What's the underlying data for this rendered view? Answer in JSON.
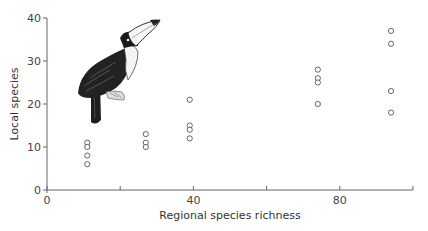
{
  "chart_data": {
    "type": "scatter",
    "title": "",
    "xlabel": "Regional species richness",
    "ylabel": "Local species",
    "xlim": [
      0,
      100
    ],
    "ylim": [
      0,
      40
    ],
    "x_ticks": [
      0,
      20,
      40,
      60,
      80,
      100
    ],
    "x_tick_labels": [
      "0",
      "",
      "40",
      "",
      "80",
      ""
    ],
    "y_ticks": [
      0,
      10,
      20,
      30,
      40
    ],
    "y_tick_labels": [
      "0",
      "10",
      "20",
      "30",
      "40"
    ],
    "grid": false,
    "legend": null,
    "marker": "open-circle",
    "illustration": "toucan",
    "series": [
      {
        "name": "sites",
        "points": [
          {
            "x": 11,
            "y": 11
          },
          {
            "x": 11,
            "y": 10
          },
          {
            "x": 11,
            "y": 8
          },
          {
            "x": 11,
            "y": 6
          },
          {
            "x": 27,
            "y": 13
          },
          {
            "x": 27,
            "y": 11
          },
          {
            "x": 27,
            "y": 10
          },
          {
            "x": 39,
            "y": 21
          },
          {
            "x": 39,
            "y": 15
          },
          {
            "x": 39,
            "y": 14
          },
          {
            "x": 39,
            "y": 12
          },
          {
            "x": 74,
            "y": 28
          },
          {
            "x": 74,
            "y": 26
          },
          {
            "x": 74,
            "y": 25
          },
          {
            "x": 74,
            "y": 20
          },
          {
            "x": 94,
            "y": 37
          },
          {
            "x": 94,
            "y": 34
          },
          {
            "x": 94,
            "y": 23
          },
          {
            "x": 94,
            "y": 18
          }
        ]
      }
    ]
  }
}
